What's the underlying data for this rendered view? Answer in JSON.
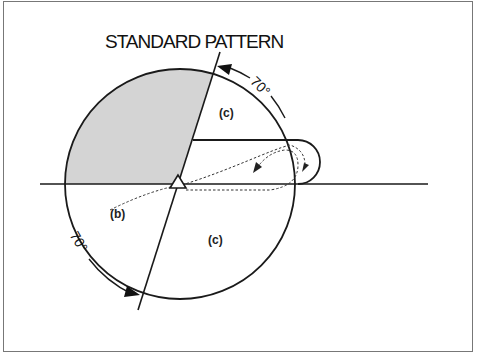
{
  "diagram": {
    "title": "STANDARD PATTERN",
    "labels": {
      "upper_region": "(c)",
      "lower_region": "(c)",
      "entry_label": "(b)",
      "angle_upper": "70°",
      "angle_lower": "70°"
    },
    "colors": {
      "shaded_sector": "#d4d4d4",
      "line": "#1a1a1a",
      "border": "#777777"
    }
  }
}
